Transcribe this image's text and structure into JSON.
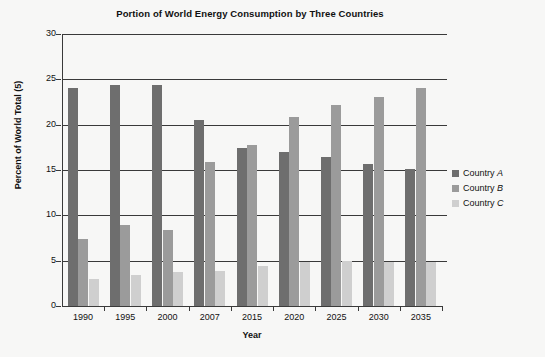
{
  "chart_data": {
    "type": "bar",
    "title": "Portion of World Energy Consumption by Three Countries",
    "xlabel": "Year",
    "ylabel": "Percent of World Total (5)",
    "categories": [
      "1990",
      "1995",
      "2000",
      "2007",
      "2015",
      "2020",
      "2025",
      "2030",
      "2035"
    ],
    "series": [
      {
        "name": "Country A",
        "color": "#6e6e6e",
        "values": [
          24.1,
          24.4,
          24.4,
          20.5,
          17.4,
          17.0,
          16.4,
          15.7,
          15.1
        ]
      },
      {
        "name": "Country B",
        "color": "#9b9b9b",
        "values": [
          7.4,
          8.9,
          8.4,
          15.9,
          17.8,
          20.8,
          22.2,
          23.1,
          24.1
        ]
      },
      {
        "name": "Country C",
        "color": "#cfcfcf",
        "values": [
          3.0,
          3.4,
          3.8,
          3.9,
          4.4,
          4.9,
          5.0,
          4.9,
          4.9
        ]
      }
    ],
    "ylim": [
      0,
      30
    ],
    "yticks": [
      0,
      5,
      10,
      15,
      20,
      25,
      30
    ],
    "ytick_labels": [
      "0",
      "5",
      "10",
      "15",
      "20",
      "25",
      "30"
    ],
    "grid": true,
    "legend_position": "right"
  },
  "legend": {
    "entries": [
      {
        "label_prefix": "Country ",
        "label_italic": "A"
      },
      {
        "label_prefix": "Country ",
        "label_italic": "B"
      },
      {
        "label_prefix": "Country ",
        "label_italic": "C"
      }
    ]
  }
}
